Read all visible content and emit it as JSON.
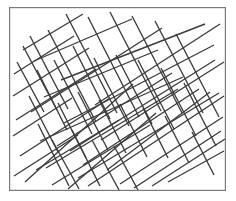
{
  "figure": {
    "canvas": {
      "width": 236,
      "height": 201
    },
    "background_color": "#ffffff"
  },
  "frame": {
    "name": "plot-border",
    "x": 9,
    "y": 7,
    "width": 217,
    "height": 184,
    "stroke_color": "#7a7a7a",
    "stroke_width": 1.2,
    "fill_color": "#ffffff"
  },
  "style": {
    "line_color": "#3b3b3b",
    "line_width": 1.35,
    "line_cap": "butt",
    "clip_to_frame": true
  },
  "chart_data": {
    "type": "line",
    "xlabel": "",
    "ylabel": "",
    "xlim": [
      9,
      226
    ],
    "ylim": [
      7,
      191
    ],
    "grid": false,
    "legend": null,
    "series": [
      {
        "name": "family-a-shallow-rising",
        "angle_deg": 31,
        "count": 30,
        "segments": [
          [
            14,
            74,
            74,
            36
          ],
          [
            13,
            96,
            89,
            48
          ],
          [
            16,
            120,
            96,
            69
          ],
          [
            13,
            136,
            72,
            98
          ],
          [
            20,
            156,
            110,
            98
          ],
          [
            14,
            176,
            78,
            135
          ],
          [
            25,
            182,
            133,
            84
          ],
          [
            34,
            61,
            132,
            19
          ],
          [
            31,
            112,
            162,
            28
          ],
          [
            40,
            141,
            183,
            77
          ],
          [
            46,
            168,
            178,
            89
          ],
          [
            52,
            185,
            150,
            125
          ],
          [
            61,
            80,
            205,
            24
          ],
          [
            64,
            123,
            214,
            45
          ],
          [
            70,
            151,
            215,
            60
          ],
          [
            78,
            178,
            219,
            93
          ],
          [
            88,
            186,
            224,
            96
          ],
          [
            95,
            105,
            220,
            24
          ],
          [
            101,
            140,
            224,
            62
          ],
          [
            107,
            170,
            210,
            92
          ],
          [
            120,
            184,
            223,
            117
          ],
          [
            134,
            188,
            221,
            131
          ],
          [
            152,
            186,
            225,
            139
          ],
          [
            23,
            50,
            83,
            14
          ],
          [
            44,
            97,
            158,
            50
          ],
          [
            57,
            146,
            172,
            73
          ],
          [
            83,
            165,
            199,
            89
          ],
          [
            36,
            170,
            119,
            120
          ],
          [
            68,
            189,
            156,
            113
          ],
          [
            168,
            182,
            224,
            151
          ]
        ]
      },
      {
        "name": "family-b-steep-falling",
        "angle_deg": -61,
        "count": 31,
        "segments": [
          [
            17,
            62,
            44,
            112
          ],
          [
            23,
            46,
            57,
            110
          ],
          [
            30,
            36,
            68,
            109
          ],
          [
            37,
            70,
            67,
            130
          ],
          [
            29,
            96,
            58,
            152
          ],
          [
            38,
            124,
            69,
            186
          ],
          [
            48,
            30,
            96,
            122
          ],
          [
            54,
            60,
            92,
            134
          ],
          [
            58,
            103,
            86,
            158
          ],
          [
            52,
            140,
            79,
            189
          ],
          [
            66,
            14,
            117,
            113
          ],
          [
            73,
            46,
            110,
            119
          ],
          [
            78,
            92,
            108,
            150
          ],
          [
            72,
            130,
            100,
            186
          ],
          [
            88,
            17,
            139,
            117
          ],
          [
            94,
            58,
            129,
            126
          ],
          [
            99,
            100,
            126,
            153
          ],
          [
            92,
            140,
            119,
            190
          ],
          [
            110,
            12,
            161,
            111
          ],
          [
            116,
            55,
            152,
            124
          ],
          [
            120,
            104,
            147,
            157
          ],
          [
            114,
            146,
            138,
            190
          ],
          [
            132,
            16,
            182,
            113
          ],
          [
            138,
            60,
            174,
            129
          ],
          [
            143,
            108,
            168,
            158
          ],
          [
            155,
            21,
            203,
            113
          ],
          [
            161,
            68,
            196,
            136
          ],
          [
            165,
            116,
            189,
            163
          ],
          [
            176,
            34,
            219,
            117
          ],
          [
            184,
            83,
            216,
            146
          ],
          [
            192,
            132,
            214,
            175
          ]
        ]
      }
    ]
  }
}
